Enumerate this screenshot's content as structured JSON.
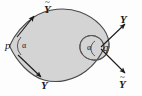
{
  "figure": {
    "colors": {
      "fill": "#d4d4d4",
      "stroke": "#4a4a4a",
      "arrow": "#1a1a1a",
      "background": "#fdfdfd",
      "label": "#1a1a1a"
    },
    "points": [
      {
        "id": "p",
        "label": "p",
        "x": 9,
        "y": 46
      },
      {
        "id": "q",
        "label": "q",
        "x": 104,
        "y": 48
      }
    ],
    "angles": [
      {
        "id": "alpha-left",
        "label": "α",
        "x": 24,
        "y": 44
      },
      {
        "id": "alpha-right",
        "label": "α",
        "x": 88,
        "y": 49
      }
    ],
    "vectors": [
      {
        "id": "Y-tilde-upper-left",
        "base": "Y",
        "accent": "~",
        "x": 46,
        "y": 3,
        "tip_x": 33,
        "tip_y": 17,
        "tail_x": 17,
        "tail_y": 37
      },
      {
        "id": "Y-lower-left",
        "base": "Y",
        "accent": "",
        "x": 43,
        "y": 80,
        "tip_x": 40,
        "tip_y": 76,
        "tail_x": 18,
        "tail_y": 55
      },
      {
        "id": "Y-upper-right",
        "base": "Y",
        "accent": "",
        "x": 121,
        "y": 14,
        "tip_x": 124,
        "tip_y": 25,
        "tail_x": 101,
        "tail_y": 47
      },
      {
        "id": "Y-tilde-lower-right",
        "base": "Y",
        "accent": "~",
        "x": 121,
        "y": 78,
        "tip_x": 124,
        "tip_y": 72,
        "tail_x": 101,
        "tail_y": 49
      }
    ]
  }
}
